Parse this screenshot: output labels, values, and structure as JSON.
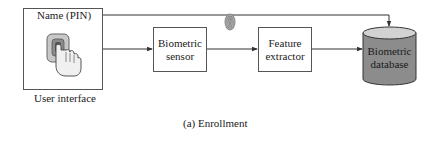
{
  "diagram": {
    "caption": "(a) Enrollment",
    "user_interface": {
      "label": "User interface",
      "field_label": "Name (PIN)",
      "icon": "finger-press-icon"
    },
    "nodes": [
      {
        "id": "sensor",
        "line1": "Biometric",
        "line2": "sensor"
      },
      {
        "id": "extractor",
        "line1": "Feature",
        "line2": "extractor"
      },
      {
        "id": "database",
        "line1": "Biometric",
        "line2": "database",
        "shape": "cylinder"
      }
    ],
    "edges": [
      {
        "from": "name-pin",
        "to": "database"
      },
      {
        "from": "user-interface",
        "to": "sensor"
      },
      {
        "from": "sensor",
        "to": "extractor",
        "icon": "fingerprint-icon"
      },
      {
        "from": "extractor",
        "to": "database"
      }
    ],
    "colors": {
      "line": "#333333",
      "database_body": "#8c8c8c",
      "database_top": "#d2d2d2",
      "keypad_bg": "#c8c8c8",
      "fingerprint": "#777777"
    }
  }
}
